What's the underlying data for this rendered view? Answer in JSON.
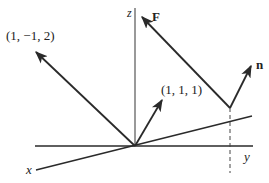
{
  "diagram": {
    "colors": {
      "line": "#2a2a2a",
      "background": "#ffffff"
    },
    "axes": {
      "x_label": "x",
      "y_label": "y",
      "z_label": "z"
    },
    "vectors": [
      {
        "label": "(1, −1, 2)"
      },
      {
        "label": "(1, 1, 1)"
      },
      {
        "label": "F"
      },
      {
        "label": "n"
      }
    ]
  }
}
